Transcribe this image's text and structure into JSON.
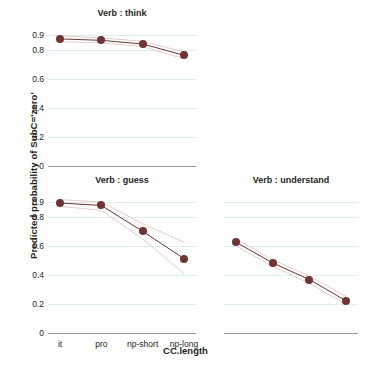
{
  "chart_data": {
    "type": "line",
    "title": "",
    "xlabel": "CC.length",
    "ylabel": "Predicted probability of SubC='zero'",
    "categories": [
      "it",
      "pro",
      "np-short",
      "np-long"
    ],
    "ylim": [
      0,
      0.95
    ],
    "ytick_labels": [
      "0",
      "0.2",
      "0.4",
      "0.6",
      "0.8",
      "0.9"
    ],
    "ytick_values": [
      0,
      0.2,
      0.4,
      0.6,
      0.8,
      0.9
    ],
    "grid": true,
    "legend": "none",
    "marker_color": "#6e3535",
    "line_color": "#6e3535",
    "ci_color": "#e8cccc",
    "gridline_color": "#ddeef0",
    "axis_color": "#9b9b9b",
    "panels": [
      {
        "id": "think",
        "title": "Verb : think",
        "position": "top-left",
        "show_y_axis": true,
        "show_x_axis_labels": false,
        "values": [
          0.875,
          0.865,
          0.84,
          0.762
        ],
        "ci_upper": [
          0.895,
          0.882,
          0.858,
          0.786
        ],
        "ci_lower": [
          0.855,
          0.848,
          0.822,
          0.738
        ]
      },
      {
        "id": "guess",
        "title": "Verb : guess",
        "position": "bottom-left",
        "show_y_axis": true,
        "show_x_axis_labels": true,
        "values": [
          0.895,
          0.878,
          0.7,
          0.512
        ],
        "ci_upper": [
          0.918,
          0.902,
          0.752,
          0.625
        ],
        "ci_lower": [
          0.872,
          0.845,
          0.648,
          0.408
        ]
      },
      {
        "id": "understand",
        "title": "Verb : understand",
        "position": "bottom-right",
        "show_y_axis": false,
        "show_x_axis_labels": false,
        "values": [
          0.625,
          0.482,
          0.368,
          0.222
        ],
        "ci_upper": [
          0.648,
          0.505,
          0.392,
          0.252
        ],
        "ci_lower": [
          0.6,
          0.458,
          0.342,
          0.196
        ]
      }
    ]
  }
}
